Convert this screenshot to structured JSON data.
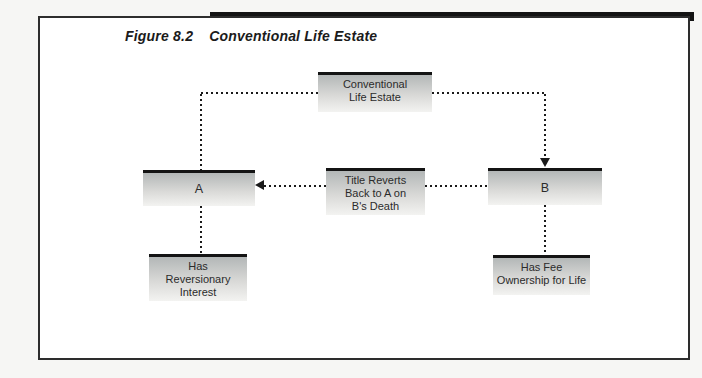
{
  "figure": {
    "label": "Figure 8.2",
    "title": "Conventional Life Estate"
  },
  "diagram": {
    "nodes": {
      "root": {
        "text": "Conventional\nLife Estate"
      },
      "a": {
        "text": "A"
      },
      "reverts": {
        "text": "Title Reverts\nBack to A on\nB's Death"
      },
      "b": {
        "text": "B"
      },
      "a_note": {
        "text": "Has\nReversionary\nInterest"
      },
      "b_note": {
        "text": "Has Fee\nOwnership for Life"
      }
    },
    "colors": {
      "line": "#1a1a1a",
      "bar": "#141414",
      "box_top": "#b3b7b7",
      "box_mid": "#d9d9d7",
      "box_bottom": "#f3f3f1"
    }
  }
}
